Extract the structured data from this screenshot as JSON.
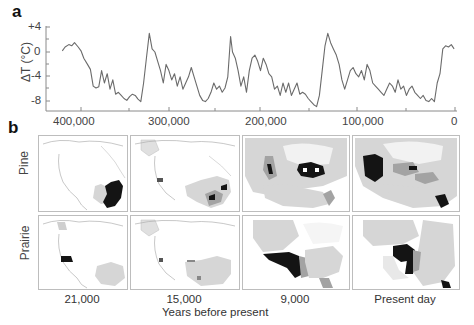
{
  "figure": {
    "panel_a_label": "a",
    "panel_b_label": "b"
  },
  "chart_data": [
    {
      "type": "line",
      "title": "",
      "xlabel": "",
      "ylabel": "ΔT (°C)",
      "x_reversed": true,
      "xlim": [
        420000,
        0
      ],
      "ylim": [
        -10,
        4
      ],
      "grid": false,
      "xticks": [
        400000,
        300000,
        200000,
        100000,
        0
      ],
      "xtick_labels": [
        "400,000",
        "300,000",
        "200,000",
        "100,000",
        "0"
      ],
      "yticks": [
        4,
        0,
        -4,
        -8
      ],
      "ytick_labels": [
        "+4",
        "0",
        "-4",
        "-8"
      ],
      "series": [
        {
          "name": "Temperature anomaly",
          "color": "#6b6b6b",
          "x": [
            420000,
            417000,
            413000,
            410000,
            407000,
            403000,
            400000,
            397000,
            393000,
            390000,
            387000,
            384000,
            381000,
            378000,
            375000,
            372000,
            369000,
            366000,
            363000,
            360000,
            357000,
            354000,
            351000,
            348000,
            345000,
            342000,
            339000,
            336000,
            333000,
            330000,
            327000,
            324000,
            321000,
            318000,
            315000,
            312000,
            309000,
            306000,
            303000,
            300000,
            297000,
            294000,
            291000,
            288000,
            285000,
            282000,
            279000,
            276000,
            273000,
            270000,
            267000,
            264000,
            261000,
            258000,
            255000,
            252000,
            249000,
            246000,
            243000,
            240000,
            238000,
            235000,
            232000,
            229000,
            226000,
            223000,
            220000,
            217000,
            214000,
            211000,
            208000,
            205000,
            202000,
            199000,
            196000,
            193000,
            190000,
            187000,
            184000,
            181000,
            178000,
            175000,
            172000,
            169000,
            166000,
            163000,
            160000,
            157000,
            154000,
            151000,
            148000,
            145000,
            142000,
            139000,
            136000,
            133000,
            130000,
            127000,
            124000,
            121000,
            118000,
            115000,
            112000,
            109000,
            106000,
            103000,
            100000,
            97000,
            94000,
            91000,
            88000,
            85000,
            82000,
            79000,
            76000,
            73000,
            70000,
            67000,
            64000,
            61000,
            58000,
            55000,
            52000,
            49000,
            46000,
            43000,
            40000,
            37000,
            34000,
            31000,
            28000,
            25000,
            22000,
            19000,
            16000,
            13000,
            10000,
            7000,
            4000,
            1000
          ],
          "values": [
            0.2,
            0.8,
            1.2,
            1.0,
            1.5,
            0.8,
            0.2,
            -1.0,
            -2.0,
            -2.8,
            -5.5,
            -5.8,
            -5.6,
            -3.0,
            -5.0,
            -3.5,
            -6.0,
            -4.5,
            -6.8,
            -6.5,
            -7.0,
            -7.5,
            -7.8,
            -7.2,
            -6.8,
            -7.0,
            -7.6,
            -8.0,
            -5.0,
            -1.0,
            3.0,
            0.5,
            0.0,
            -1.5,
            -3.0,
            -5.0,
            -2.0,
            -3.0,
            -4.5,
            -3.5,
            -5.5,
            -4.0,
            -6.0,
            -5.0,
            -4.0,
            -2.5,
            -4.0,
            -5.5,
            -7.0,
            -7.8,
            -8.0,
            -7.5,
            -6.5,
            -5.0,
            -6.0,
            -5.5,
            -6.5,
            -5.8,
            -4.0,
            2.5,
            0.0,
            -1.0,
            -3.0,
            -5.5,
            -4.0,
            -6.5,
            -3.0,
            -1.0,
            -0.5,
            -1.5,
            -3.0,
            -1.0,
            -2.0,
            -3.5,
            -4.0,
            -6.0,
            -5.5,
            -7.0,
            -5.0,
            -6.5,
            -5.0,
            -7.0,
            -6.0,
            -5.0,
            -6.8,
            -6.5,
            -6.8,
            -7.5,
            -8.0,
            -8.5,
            -8.8,
            -7.0,
            -3.0,
            1.0,
            3.0,
            1.5,
            0.5,
            -0.5,
            -2.0,
            -4.5,
            -6.0,
            -4.5,
            -3.0,
            -2.5,
            -3.5,
            -4.0,
            -3.0,
            -4.5,
            -2.0,
            -3.0,
            -5.0,
            -5.5,
            -6.0,
            -6.5,
            -7.0,
            -6.0,
            -5.0,
            -5.5,
            -6.5,
            -4.5,
            -6.0,
            -5.5,
            -7.0,
            -6.0,
            -5.5,
            -6.5,
            -7.0,
            -7.5,
            -7.0,
            -7.8,
            -8.0,
            -7.5,
            -8.0,
            -5.0,
            -3.5,
            0.5,
            1.0,
            0.8,
            1.2,
            0.5
          ]
        }
      ]
    },
    {
      "type": "map-grid",
      "rows": [
        "Pine",
        "Prairie"
      ],
      "columns": [
        "21,000",
        "15,000",
        "9,000",
        "Present day"
      ],
      "xlabel": "Years before present",
      "legend_colors": {
        "low": "#d9d9d9",
        "mid": "#a3a3a3",
        "high": "#141414"
      }
    }
  ],
  "panel_a": {
    "ylabel": "ΔT (°C)",
    "yticks": [
      "+4",
      "0",
      "-4",
      "-8"
    ],
    "xticks": [
      "400,000",
      "300,000",
      "200,000",
      "100,000",
      "0"
    ]
  },
  "panel_b": {
    "rows": [
      "Pine",
      "Prairie"
    ],
    "columns": [
      "21,000",
      "15,000",
      "9,000",
      "Present day"
    ],
    "xlabel": "Years before present"
  }
}
